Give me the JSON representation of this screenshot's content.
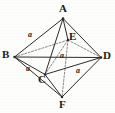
{
  "figure": {
    "kind": "octahedron-diagram",
    "stroke_color": "#2b2b2b",
    "dashed_color": "#6d6d6d",
    "background_color": "#fdfdfc",
    "vertices": [
      {
        "id": "A",
        "label": "A",
        "x": 63.0,
        "y": 18.5,
        "label_x": 59,
        "label_y": 3
      },
      {
        "id": "B",
        "label": "B",
        "x": 14.5,
        "y": 57.0,
        "label_x": 2,
        "label_y": 49
      },
      {
        "id": "C",
        "label": "C",
        "x": 45.0,
        "y": 74.5,
        "label_x": 38,
        "label_y": 74
      },
      {
        "id": "D",
        "label": "D",
        "x": 101.0,
        "y": 57.5,
        "label_x": 103,
        "label_y": 50
      },
      {
        "id": "E",
        "label": "E",
        "x": 68.0,
        "y": 40.0,
        "label_x": 69,
        "label_y": 31
      },
      {
        "id": "F",
        "label": "F",
        "x": 62.0,
        "y": 97.0,
        "label_x": 59,
        "label_y": 99
      }
    ],
    "solid_edges": [
      {
        "from": "A",
        "to": "B"
      },
      {
        "from": "A",
        "to": "C"
      },
      {
        "from": "A",
        "to": "D"
      },
      {
        "from": "A",
        "to": "E"
      },
      {
        "from": "B",
        "to": "C"
      },
      {
        "from": "B",
        "to": "F"
      },
      {
        "from": "C",
        "to": "D"
      },
      {
        "from": "C",
        "to": "F"
      },
      {
        "from": "D",
        "to": "F"
      },
      {
        "from": "B",
        "to": "D"
      }
    ],
    "dashed_edges": [
      {
        "from": "B",
        "to": "E"
      },
      {
        "from": "E",
        "to": "D"
      },
      {
        "from": "E",
        "to": "F"
      },
      {
        "from": "E",
        "to": "C"
      }
    ],
    "edge_labels": [
      {
        "id": "label-ab",
        "text": "a",
        "x": 28,
        "y": 31,
        "edge": "A-B"
      },
      {
        "id": "label-bc",
        "text": "a",
        "x": 26,
        "y": 65,
        "edge": "B-C"
      },
      {
        "id": "label-cd",
        "text": "a",
        "x": 76,
        "y": 67,
        "edge": "C-D"
      },
      {
        "id": "label-ae",
        "text": "a",
        "x": 60,
        "y": 52,
        "edge": "A-E"
      }
    ]
  }
}
